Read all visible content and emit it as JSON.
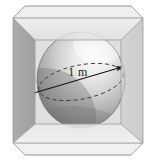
{
  "figure": {
    "name": "sphere-inscribed-in-cube",
    "caption_text": "1 m",
    "background_color": "#ffffff",
    "annotations": [
      {
        "id": "diameter-label",
        "text": "1 m",
        "quantity": 1,
        "unit": "m",
        "describes": "sphere-diameter",
        "text_color": "#1a1a1a"
      }
    ],
    "shapes": {
      "cube": {
        "name": "glass-cube",
        "style": "translucent-gray-panels",
        "faces": [
          {
            "id": "cube-top-face",
            "label": "top",
            "fill": "#e9e9e9"
          },
          {
            "id": "cube-left-face",
            "label": "left",
            "fill": "#a9a9a9"
          },
          {
            "id": "cube-right-face",
            "label": "right",
            "fill": "#cfcfcf"
          },
          {
            "id": "cube-bottom-face",
            "label": "bottom",
            "fill": "#ededed"
          },
          {
            "id": "cube-back-face",
            "label": "back",
            "fill": "#dcdcdc"
          }
        ],
        "edge_color": "#9a9a9a"
      },
      "sphere": {
        "name": "inscribed-sphere",
        "diameter_label": "1 m",
        "fill_light": "#f2f2f2",
        "fill_mid": "#b8b8b8",
        "fill_dark": "#6e6e6e",
        "outline_color": "#6a6a6a",
        "highlight_position": "upper-right"
      },
      "equator": {
        "name": "equator-ellipse",
        "style": "dashed",
        "stroke_color": "#3a3a3a"
      },
      "diameter_arrow": {
        "name": "diameter-arrow",
        "style": "solid-with-arrowhead",
        "stroke_color": "#1a1a1a",
        "direction": "lower-left-to-upper-right"
      }
    }
  }
}
